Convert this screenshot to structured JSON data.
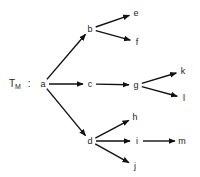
{
  "diagram": {
    "title_symbol": "T",
    "title_subscript": "M",
    "separator": ":",
    "nodes": [
      {
        "id": "a",
        "label": "a",
        "x": 43,
        "y": 84
      },
      {
        "id": "b",
        "label": "b",
        "x": 90,
        "y": 29
      },
      {
        "id": "c",
        "label": "c",
        "x": 90,
        "y": 84
      },
      {
        "id": "d",
        "label": "d",
        "x": 90,
        "y": 141
      },
      {
        "id": "e",
        "label": "e",
        "x": 136,
        "y": 13
      },
      {
        "id": "f",
        "label": "f",
        "x": 137,
        "y": 42
      },
      {
        "id": "g",
        "label": "g",
        "x": 136,
        "y": 85
      },
      {
        "id": "k",
        "label": "k",
        "x": 183,
        "y": 71
      },
      {
        "id": "l",
        "label": "l",
        "x": 184,
        "y": 98
      },
      {
        "id": "h",
        "label": "h",
        "x": 135,
        "y": 117
      },
      {
        "id": "i",
        "label": "i",
        "x": 137,
        "y": 141
      },
      {
        "id": "j",
        "label": "j",
        "x": 135,
        "y": 166
      },
      {
        "id": "m",
        "label": "m",
        "x": 182,
        "y": 141
      }
    ],
    "edges": [
      {
        "from": "a",
        "to": "b"
      },
      {
        "from": "a",
        "to": "c"
      },
      {
        "from": "a",
        "to": "d"
      },
      {
        "from": "b",
        "to": "e"
      },
      {
        "from": "b",
        "to": "f"
      },
      {
        "from": "c",
        "to": "g"
      },
      {
        "from": "g",
        "to": "k"
      },
      {
        "from": "g",
        "to": "l"
      },
      {
        "from": "d",
        "to": "h"
      },
      {
        "from": "d",
        "to": "i"
      },
      {
        "from": "d",
        "to": "j"
      },
      {
        "from": "i",
        "to": "m"
      }
    ],
    "colors": {
      "line": "#111111",
      "text": "#222222",
      "background": "#ffffff"
    }
  }
}
